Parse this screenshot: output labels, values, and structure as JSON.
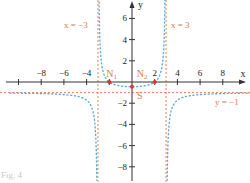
{
  "chart_data": {
    "type": "line",
    "title": "",
    "function": "y = (x^2 - 4) / (9 - x^2)",
    "xlabel": "x",
    "ylabel": "y",
    "xlim": [
      -10.5,
      10.5
    ],
    "ylim": [
      -9,
      7.5
    ],
    "grid": false,
    "x_ticks": [
      -8,
      -6,
      -4,
      2,
      4,
      6,
      8
    ],
    "x_tick_labels": [
      "−8",
      "−6",
      "−4",
      "2",
      "4",
      "6",
      "8"
    ],
    "y_ticks": [
      6,
      4,
      2,
      -2,
      -4,
      -6,
      -8
    ],
    "y_tick_labels": [
      "6",
      "4",
      "2",
      "−2",
      "−4",
      "−6",
      "−8"
    ],
    "asymptotes": [
      {
        "type": "vertical",
        "value": -3,
        "label": "x = −3"
      },
      {
        "type": "vertical",
        "value": 3,
        "label": "x = 3"
      },
      {
        "type": "horizontal",
        "value": -1,
        "label": "y = −1"
      }
    ],
    "points": [
      {
        "name": "N1",
        "label_main": "N",
        "label_sub": "1",
        "x": -2,
        "y": 0
      },
      {
        "name": "N2",
        "label_main": "N",
        "label_sub": "2",
        "x": 2,
        "y": 0
      },
      {
        "name": "S",
        "label_main": "S",
        "label_sub": "",
        "x": 0,
        "y": -0.44
      }
    ],
    "series": [
      {
        "name": "left branch",
        "x_range": [
          -10.5,
          -3
        ],
        "style": "dashed",
        "color": "#5aa9d6"
      },
      {
        "name": "middle branch",
        "x_range": [
          -3,
          3
        ],
        "style": "dashed",
        "color": "#5aa9d6"
      },
      {
        "name": "right branch",
        "x_range": [
          3,
          10.5
        ],
        "style": "dashed",
        "color": "#5aa9d6"
      }
    ],
    "colors": {
      "curve": "#5aa9d6",
      "asymptote": "#e8825a",
      "points": "#d9352b",
      "labels": "#e07b4f",
      "axis": "#333333"
    }
  },
  "caption": "Fig. 4"
}
